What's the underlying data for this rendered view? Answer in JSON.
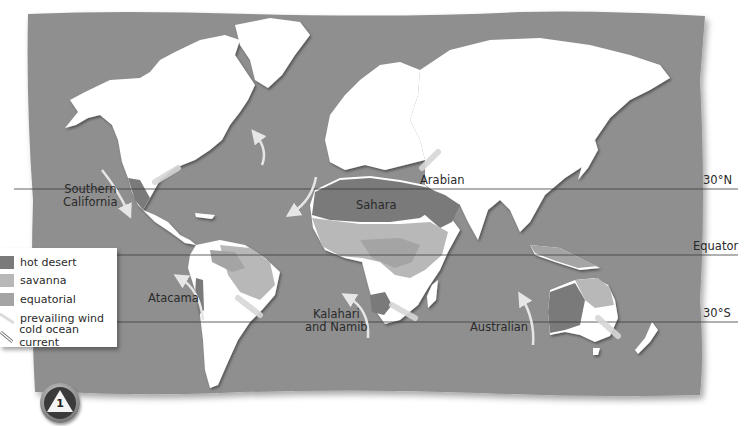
{
  "map": {
    "type": "world-desert-map",
    "colors": {
      "ocean": "#8f8f8f",
      "land": "#ffffff",
      "hot_desert": "#7a7a7a",
      "savanna": "#b8b8b8",
      "equatorial": "#a4a4a4",
      "prevailing_wind": "#e0e0e0",
      "cold_ocean_current": "#d9d9d9",
      "latitude_line": "#3a3a3a"
    },
    "latitude_lines": [
      {
        "label": "30°N",
        "y": 189
      },
      {
        "label": "Equator",
        "y": 255
      },
      {
        "label": "30°S",
        "y": 322
      }
    ],
    "desert_labels": [
      {
        "name": "Southern California",
        "line1": "Southern",
        "line2": "California"
      },
      {
        "name": "Sahara"
      },
      {
        "name": "Arabian"
      },
      {
        "name": "Atacama"
      },
      {
        "name": "Kalahari and Namib",
        "line1": "Kalahari",
        "line2": "and Namib"
      },
      {
        "name": "Australian"
      }
    ]
  },
  "legend": {
    "items": [
      {
        "label": "hot desert",
        "icon": "hot-desert-swatch"
      },
      {
        "label": "savanna",
        "icon": "savanna-swatch"
      },
      {
        "label": "equatorial",
        "icon": "equatorial-swatch"
      },
      {
        "label": "prevailing wind",
        "icon": "prevailing-wind-arrow"
      },
      {
        "label": "cold ocean current",
        "icon": "cold-ocean-current-arrow"
      }
    ]
  },
  "badge": {
    "number": "1",
    "icon": "triangle-badge"
  }
}
